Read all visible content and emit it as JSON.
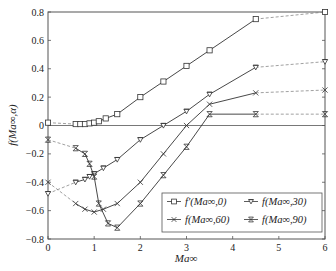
{
  "chart_data": {
    "type": "line",
    "title": "",
    "xlabel": "Ma∞",
    "ylabel": "f(Ma∞,α)",
    "xlim": [
      0,
      6
    ],
    "ylim": [
      -0.8,
      0.8
    ],
    "xticks": [
      0,
      1,
      2,
      3,
      4,
      5,
      6
    ],
    "yticks": [
      -0.8,
      -0.6,
      -0.4,
      -0.2,
      0,
      0.2,
      0.4,
      0.6,
      0.8
    ],
    "ytick_labels": [
      "−0.8",
      "−0.6",
      "−0.4",
      "−0.2",
      "0",
      "0.2",
      "0.4",
      "0.6",
      "0.8"
    ],
    "grid": false,
    "zero_line": true,
    "legend_position": "lower right",
    "series": [
      {
        "name": "f′(Ma∞,0)",
        "marker": "square",
        "x": [
          0,
          0.6,
          0.7,
          0.8,
          0.9,
          1.0,
          1.1,
          1.25,
          1.5,
          2.0,
          2.5,
          3.0,
          3.5,
          4.5,
          6
        ],
        "y": [
          0.02,
          0.01,
          0.01,
          0.01,
          0.015,
          0.02,
          0.03,
          0.05,
          0.08,
          0.2,
          0.31,
          0.42,
          0.53,
          0.75,
          0.8
        ],
        "dashed_segments": [
          [
            0,
            0.6
          ],
          [
            4.5,
            6
          ]
        ]
      },
      {
        "name": "f(Ma∞,30)",
        "marker": "triangle-down",
        "x": [
          0,
          0.6,
          0.8,
          0.9,
          1.0,
          1.2,
          1.5,
          2.0,
          2.5,
          3.0,
          3.5,
          4.5,
          6
        ],
        "y": [
          -0.48,
          -0.4,
          -0.38,
          -0.36,
          -0.34,
          -0.3,
          -0.24,
          -0.1,
          0.0,
          0.1,
          0.22,
          0.41,
          0.45
        ],
        "dashed_segments": [
          [
            0,
            0.6
          ],
          [
            4.5,
            6
          ]
        ]
      },
      {
        "name": "f(Ma∞,60)",
        "marker": "x",
        "x": [
          0,
          0.6,
          0.8,
          1.0,
          1.2,
          1.5,
          2.0,
          2.5,
          3.0,
          3.5,
          4.5,
          6
        ],
        "y": [
          -0.4,
          -0.55,
          -0.59,
          -0.61,
          -0.59,
          -0.55,
          -0.4,
          -0.2,
          0.0,
          0.15,
          0.23,
          0.25
        ],
        "dashed_segments": [
          [
            0,
            0.6
          ],
          [
            4.5,
            6
          ]
        ]
      },
      {
        "name": "f(Ma∞,90)",
        "marker": "hourglass-x",
        "x": [
          0,
          0.6,
          0.8,
          0.9,
          1.0,
          1.1,
          1.3,
          1.5,
          2.0,
          2.5,
          3.0,
          3.5,
          4.5,
          6
        ],
        "y": [
          -0.1,
          -0.16,
          -0.2,
          -0.27,
          -0.36,
          -0.55,
          -0.69,
          -0.72,
          -0.55,
          -0.35,
          -0.15,
          0.08,
          0.08,
          0.08
        ],
        "dashed_segments": [
          [
            0,
            0.6
          ],
          [
            4.5,
            6
          ]
        ]
      }
    ]
  },
  "legend": {
    "items": [
      {
        "prefix": "f′",
        "args": "(Ma∞,0)",
        "label": "f′(Ma∞,0)"
      },
      {
        "prefix": "f",
        "args": "(Ma∞,30)",
        "label": "f(Ma∞,30)"
      },
      {
        "prefix": "f",
        "args": "(Ma∞,60)",
        "label": "f(Ma∞,60)"
      },
      {
        "prefix": "f",
        "args": "(Ma∞,90)",
        "label": "f(Ma∞,90)"
      }
    ]
  },
  "axes": {
    "xlabel": "Ma∞",
    "ylabel": "f(Ma∞,α)"
  },
  "colors": {
    "line": "#333333",
    "axis": "#555555"
  }
}
